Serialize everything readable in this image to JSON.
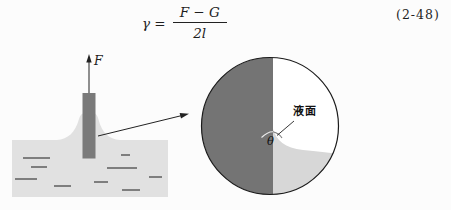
{
  "equation": {
    "lhs": "γ =",
    "numerator": "F − G",
    "denominator": "2l",
    "number": "(2-48)"
  },
  "plate_diagram": {
    "force_label": "F"
  },
  "magnified_view": {
    "surface_label": "液面",
    "angle_label": "θ"
  },
  "colors": {
    "plate": "#7a7a7a",
    "tank_liquid": "#e1e1e1",
    "magnified_plate": "#747474",
    "magnified_liquid": "#d7d7d7",
    "outline": "#1b1b1b"
  }
}
